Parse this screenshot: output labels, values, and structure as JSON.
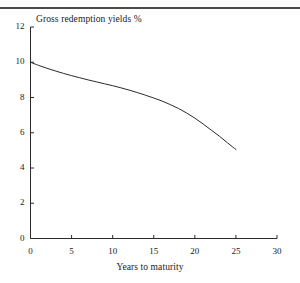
{
  "page": {
    "background_color": "#ffffff",
    "ink_color": "#1a1a1a",
    "rule_color": "#4a4a4a"
  },
  "chart_data": {
    "type": "line",
    "title": "Gross redemption yields %",
    "xlabel": "Years to maturity",
    "ylabel": "",
    "xlim": [
      0,
      30
    ],
    "ylim": [
      0,
      12
    ],
    "xticks": [
      0,
      5,
      10,
      15,
      20,
      25,
      30
    ],
    "xtick_labels": [
      "0",
      "5",
      "10",
      "15",
      "20",
      "25",
      "30"
    ],
    "yticks": [
      0,
      2,
      4,
      6,
      8,
      10,
      12
    ],
    "ytick_labels": [
      "0",
      "2",
      "4",
      "6",
      "8",
      "10",
      "12"
    ],
    "grid": false,
    "legend": false,
    "legend_position": "none",
    "series": [
      {
        "name": "Gross redemption yield",
        "color": "#2b2b2b",
        "line_width": 1,
        "x": [
          0,
          1,
          2,
          3,
          4,
          5,
          6,
          7,
          8,
          9,
          10,
          11,
          12,
          13,
          14,
          15,
          16,
          17,
          18,
          19,
          20,
          21,
          22,
          23,
          24,
          25
        ],
        "values": [
          10.0,
          9.82,
          9.66,
          9.51,
          9.37,
          9.24,
          9.12,
          9.0,
          8.89,
          8.78,
          8.67,
          8.55,
          8.42,
          8.28,
          8.13,
          7.97,
          7.8,
          7.6,
          7.38,
          7.12,
          6.83,
          6.5,
          6.15,
          5.8,
          5.42,
          5.05
        ]
      }
    ],
    "annotations": []
  },
  "axis_titles": {
    "x": "Years to maturity",
    "y_top_caption": "Gross redemption yields %"
  }
}
